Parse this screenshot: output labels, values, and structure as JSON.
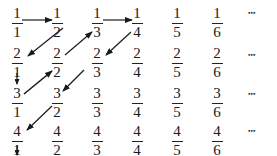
{
  "grid": {
    "rows": [
      [
        {
          "n": "1",
          "d": "1"
        },
        {
          "n": "1",
          "d": "2"
        },
        {
          "n": "1",
          "d": "3"
        },
        {
          "n": "1",
          "d": "4"
        },
        {
          "n": "1",
          "d": "5"
        },
        {
          "n": "1",
          "d": "6"
        }
      ],
      [
        {
          "n": "2",
          "d": "1"
        },
        {
          "n": "2",
          "d": "2"
        },
        {
          "n": "2",
          "d": "3"
        },
        {
          "n": "2",
          "d": "4"
        },
        {
          "n": "2",
          "d": "5"
        },
        {
          "n": "2",
          "d": "6"
        }
      ],
      [
        {
          "n": "3",
          "d": "1"
        },
        {
          "n": "3",
          "d": "2"
        },
        {
          "n": "3",
          "d": "3"
        },
        {
          "n": "3",
          "d": "4"
        },
        {
          "n": "3",
          "d": "5"
        },
        {
          "n": "3",
          "d": "6"
        }
      ],
      [
        {
          "n": "4",
          "d": "1"
        },
        {
          "n": "4",
          "d": "2"
        },
        {
          "n": "4",
          "d": "3"
        },
        {
          "n": "4",
          "d": "4"
        },
        {
          "n": "4",
          "d": "5"
        },
        {
          "n": "4",
          "d": "6"
        }
      ]
    ],
    "ellipsis": "•••"
  },
  "arrows": [
    {
      "from": "1/1",
      "to": "1/2"
    },
    {
      "from": "1/2",
      "to": "2/1"
    },
    {
      "from": "2/1",
      "to": "3/1"
    },
    {
      "from": "3/1",
      "to": "2/2"
    },
    {
      "from": "2/2",
      "to": "1/3"
    },
    {
      "from": "1/3",
      "to": "1/4"
    },
    {
      "from": "1/4",
      "to": "2/3"
    },
    {
      "from": "2/3",
      "to": "3/2"
    },
    {
      "from": "3/2",
      "to": "4/1"
    },
    {
      "from": "4/1",
      "to": "down"
    }
  ],
  "colors": {
    "ink": "#1a1a1a"
  }
}
